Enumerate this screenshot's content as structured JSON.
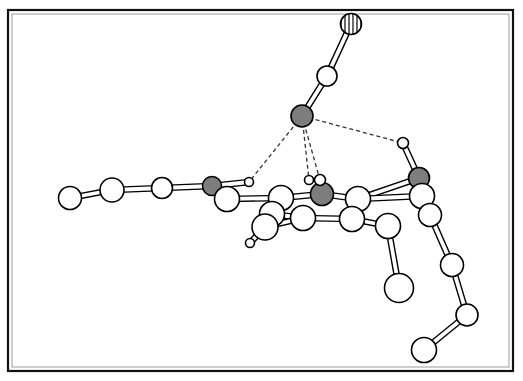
{
  "figure": {
    "kind": "ball-and-stick-molecular-structure",
    "title": "",
    "caption": "",
    "background_color": "#ffffff",
    "frame": {
      "visible": true,
      "x": 8,
      "y": 10,
      "width": 505,
      "height": 361,
      "stroke_color": "#111111",
      "stroke_width": 2.2,
      "inner_stroke_color": "#6f6f6f",
      "inner_stroke_width": 0.7
    }
  },
  "style": {
    "atom_fill_white": "#ffffff",
    "atom_fill_gray": "#7d7d7d",
    "atom_fill_hatched_base": "#cfcfcf",
    "atom_stroke": "#000000",
    "atom_stroke_width": 1.6,
    "bond_stroke": "#000000",
    "bond_outline_width": 1.4,
    "bond_fill": "#ffffff",
    "hbond_stroke": "#333333",
    "hbond_width": 1.3,
    "hbond_dash": "4,3"
  },
  "legend": {
    "visible": false,
    "entries": [
      {
        "key": "white",
        "label": "light atom (C / H)",
        "fill": "#ffffff"
      },
      {
        "key": "gray",
        "label": "heteroatom (O / N)",
        "fill": "#7d7d7d"
      },
      {
        "key": "hatched",
        "label": "terminal hatched atom",
        "fill": "#cfcfcf"
      }
    ]
  },
  "atoms": [
    {
      "id": "a1",
      "label": "C1",
      "x": 70,
      "y": 198,
      "r": 11.5,
      "fill": "white"
    },
    {
      "id": "a2",
      "label": "C2",
      "x": 112,
      "y": 190,
      "r": 12.0,
      "fill": "white"
    },
    {
      "id": "a3",
      "label": "C3",
      "x": 162,
      "y": 188,
      "r": 10.5,
      "fill": "white"
    },
    {
      "id": "a4",
      "label": "O4",
      "x": 212,
      "y": 186,
      "r": 9.5,
      "fill": "gray"
    },
    {
      "id": "a5",
      "label": "C5",
      "x": 227,
      "y": 199,
      "r": 12.5,
      "fill": "white"
    },
    {
      "id": "a6",
      "label": "H6",
      "x": 249,
      "y": 182,
      "r": 4.5,
      "fill": "white"
    },
    {
      "id": "b1",
      "label": "C7",
      "x": 281,
      "y": 198,
      "r": 12.5,
      "fill": "white"
    },
    {
      "id": "b2",
      "label": "O8",
      "x": 322,
      "y": 194,
      "r": 11.5,
      "fill": "gray"
    },
    {
      "id": "b3",
      "label": "C9",
      "x": 358,
      "y": 199,
      "r": 12.5,
      "fill": "white"
    },
    {
      "id": "b4",
      "label": "C10",
      "x": 352,
      "y": 219,
      "r": 12.5,
      "fill": "white"
    },
    {
      "id": "b5",
      "label": "C11",
      "x": 303,
      "y": 218,
      "r": 12.5,
      "fill": "white"
    },
    {
      "id": "b6",
      "label": "C12",
      "x": 272,
      "y": 214,
      "r": 12.5,
      "fill": "white"
    },
    {
      "id": "c1",
      "label": "C13",
      "x": 265,
      "y": 227,
      "r": 13.0,
      "fill": "white"
    },
    {
      "id": "c2",
      "label": "H14",
      "x": 250,
      "y": 243,
      "r": 4.5,
      "fill": "white"
    },
    {
      "id": "d1",
      "label": "H15",
      "x": 309,
      "y": 180,
      "r": 4.5,
      "fill": "white"
    },
    {
      "id": "d2",
      "label": "H16",
      "x": 320,
      "y": 180,
      "r": 5.5,
      "fill": "white"
    },
    {
      "id": "e1",
      "label": "O17",
      "x": 302,
      "y": 116,
      "r": 11.0,
      "fill": "gray"
    },
    {
      "id": "e2",
      "label": "C18",
      "x": 327,
      "y": 76,
      "r": 10.0,
      "fill": "white"
    },
    {
      "id": "e3",
      "label": "X19",
      "x": 351,
      "y": 24,
      "r": 10.5,
      "fill": "hatched"
    },
    {
      "id": "f1",
      "label": "H20",
      "x": 403,
      "y": 143,
      "r": 5.5,
      "fill": "white"
    },
    {
      "id": "f2",
      "label": "O21",
      "x": 419,
      "y": 178,
      "r": 10.5,
      "fill": "gray"
    },
    {
      "id": "f3",
      "label": "C22",
      "x": 422,
      "y": 196,
      "r": 12.5,
      "fill": "white"
    },
    {
      "id": "f4",
      "label": "C23",
      "x": 430,
      "y": 215,
      "r": 11.5,
      "fill": "white"
    },
    {
      "id": "g1",
      "label": "C24",
      "x": 388,
      "y": 226,
      "r": 12.5,
      "fill": "white"
    },
    {
      "id": "g2",
      "label": "O25",
      "x": 399,
      "y": 288,
      "r": 14.5,
      "fill": "white"
    },
    {
      "id": "h1",
      "label": "C26",
      "x": 452,
      "y": 265,
      "r": 11.5,
      "fill": "white"
    },
    {
      "id": "h2",
      "label": "C27",
      "x": 467,
      "y": 315,
      "r": 11.0,
      "fill": "white"
    },
    {
      "id": "h3",
      "label": "C28",
      "x": 424,
      "y": 350,
      "r": 12.5,
      "fill": "white"
    }
  ],
  "bonds": [
    {
      "from": "a1",
      "to": "a2",
      "order": 1,
      "kind": "stick"
    },
    {
      "from": "a2",
      "to": "a3",
      "order": 1,
      "kind": "stick"
    },
    {
      "from": "a3",
      "to": "a4",
      "order": 1,
      "kind": "stick"
    },
    {
      "from": "a4",
      "to": "a5",
      "order": 1,
      "kind": "stick"
    },
    {
      "from": "a4",
      "to": "a6",
      "order": 1,
      "kind": "stick"
    },
    {
      "from": "a5",
      "to": "b1",
      "order": 1,
      "kind": "stick"
    },
    {
      "from": "b1",
      "to": "b2",
      "order": 1,
      "kind": "stick"
    },
    {
      "from": "b2",
      "to": "b3",
      "order": 1,
      "kind": "stick"
    },
    {
      "from": "b3",
      "to": "b4",
      "order": 1,
      "kind": "stick"
    },
    {
      "from": "b4",
      "to": "b5",
      "order": 1,
      "kind": "stick"
    },
    {
      "from": "b5",
      "to": "b6",
      "order": 1,
      "kind": "stick"
    },
    {
      "from": "b6",
      "to": "b1",
      "order": 1,
      "kind": "stick"
    },
    {
      "from": "b6",
      "to": "c1",
      "order": 1,
      "kind": "stick"
    },
    {
      "from": "c1",
      "to": "c2",
      "order": 1,
      "kind": "stick"
    },
    {
      "from": "b5",
      "to": "c1",
      "order": 1,
      "kind": "stick"
    },
    {
      "from": "b2",
      "to": "d2",
      "order": 1,
      "kind": "stick"
    },
    {
      "from": "e1",
      "to": "e2",
      "order": 1,
      "kind": "stick"
    },
    {
      "from": "e2",
      "to": "e3",
      "order": 1,
      "kind": "stick"
    },
    {
      "from": "f1",
      "to": "f2",
      "order": 1,
      "kind": "stick"
    },
    {
      "from": "f2",
      "to": "f3",
      "order": 1,
      "kind": "stick"
    },
    {
      "from": "b3",
      "to": "f2",
      "order": 1,
      "kind": "stick"
    },
    {
      "from": "b3",
      "to": "f3",
      "order": 1,
      "kind": "stick"
    },
    {
      "from": "f3",
      "to": "f4",
      "order": 1,
      "kind": "stick"
    },
    {
      "from": "f4",
      "to": "h1",
      "order": 1,
      "kind": "stick"
    },
    {
      "from": "b4",
      "to": "g1",
      "order": 1,
      "kind": "stick"
    },
    {
      "from": "g1",
      "to": "g2",
      "order": 1,
      "kind": "stick"
    },
    {
      "from": "h1",
      "to": "h2",
      "order": 1,
      "kind": "stick"
    },
    {
      "from": "h2",
      "to": "h3",
      "order": 1,
      "kind": "stick"
    }
  ],
  "hydrogen_bonds": [
    {
      "from": "e1",
      "to": "a6",
      "kind": "dashed"
    },
    {
      "from": "e1",
      "to": "d1",
      "kind": "dashed"
    },
    {
      "from": "e1",
      "to": "d2",
      "kind": "dashed"
    },
    {
      "from": "e1",
      "to": "f1",
      "kind": "dashed"
    }
  ],
  "annotations": {
    "top_left_mark": {
      "visible": true,
      "text": "",
      "x": 30,
      "y": 6
    }
  }
}
